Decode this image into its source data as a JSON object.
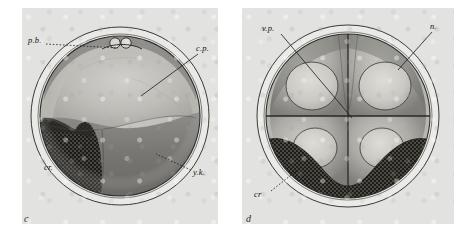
{
  "figure": {
    "kind": "halftone-plate",
    "background_hex": "#ffffff",
    "plate_hex": "#e2e2e0",
    "ink_hex": "#1a1a1a",
    "panel_count": 2
  },
  "panels": [
    {
      "id": "c",
      "letter": "c",
      "caption_letter": "c",
      "description": "Uncleaved egg in optical section; polar bodies at animal pole, cytoplasmic cap, dark stippled crescent and yolk mass.",
      "labels": [
        {
          "key": "pb",
          "text": "p.b.",
          "title": "polar bodies",
          "x": 28,
          "y": 40,
          "leader_style": "dotted",
          "leader": {
            "x1": 46,
            "y1": 44,
            "x2": 118,
            "y2": 48
          }
        },
        {
          "key": "cp",
          "text": "c.p.",
          "title": "cytoplasm",
          "x": 196,
          "y": 48,
          "leader_style": "solid",
          "leader": {
            "x1": 198,
            "y1": 54,
            "x2": 141,
            "y2": 96
          }
        },
        {
          "key": "cr",
          "text": "cr.",
          "title": "crescent",
          "x": 46,
          "y": 167,
          "leader_style": "dotted",
          "leader": {
            "x1": 62,
            "y1": 166,
            "x2": 86,
            "y2": 144
          }
        },
        {
          "key": "yk",
          "text": "y.k.",
          "title": "yolk",
          "x": 193,
          "y": 172,
          "leader_style": "dotted",
          "leader": {
            "x1": 191,
            "y1": 170,
            "x2": 156,
            "y2": 154
          }
        }
      ]
    },
    {
      "id": "d",
      "letter": "d",
      "caption_letter": "d",
      "description": "Four-cell stage; four blastomeres each with a nucleus, cleavage furrows crossing at centre, dark stippled crescent material below.",
      "labels": [
        {
          "key": "vp",
          "text": "v.p.",
          "title": "vegetal plasm",
          "x": 263,
          "y": 28,
          "leader_style": "solid",
          "leader": {
            "x1": 281,
            "y1": 34,
            "x2": 352,
            "y2": 118
          }
        },
        {
          "key": "n",
          "text": "n.",
          "title": "nucleus",
          "x": 430,
          "y": 26,
          "leader_style": "solid",
          "leader": {
            "x1": 432,
            "y1": 32,
            "x2": 398,
            "y2": 70
          }
        },
        {
          "key": "cr",
          "text": "cr",
          "title": "crescent",
          "x": 256,
          "y": 194,
          "leader_style": "dotted",
          "leader": {
            "x1": 271,
            "y1": 191,
            "x2": 300,
            "y2": 168
          }
        }
      ]
    }
  ]
}
